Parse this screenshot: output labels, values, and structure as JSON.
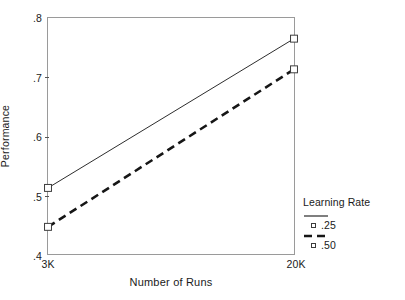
{
  "chart_data": {
    "type": "line",
    "title": "",
    "xlabel": "Number of Runs",
    "ylabel": "Performance",
    "categories": [
      "3K",
      "20K"
    ],
    "x_tick_labels": [
      "3K",
      "20K"
    ],
    "y_tick_labels": [
      ".8",
      ".7",
      ".6",
      ".5",
      ".4"
    ],
    "y_tick_values": [
      0.8,
      0.7,
      0.6,
      0.5,
      0.4
    ],
    "ylim": [
      0.4,
      0.8
    ],
    "xlim": [
      0,
      1
    ],
    "grid": false,
    "legend_position": "right",
    "legend_title": "Learning Rate",
    "marker": "open-square",
    "series": [
      {
        "name": ".25",
        "linestyle": "solid",
        "linewidth": 1,
        "color": "#2b2b2b",
        "values": [
          0.512,
          0.765
        ]
      },
      {
        "name": ".50",
        "linestyle": "dashed",
        "linewidth": 2.6,
        "color": "#161616",
        "values": [
          0.446,
          0.713
        ]
      }
    ]
  },
  "axes": {
    "y_title": "Performance",
    "x_title": "Number of Runs",
    "y_ticks": [
      {
        "label": ".8",
        "value": 0.8
      },
      {
        "label": ".7",
        "value": 0.7
      },
      {
        "label": ".6",
        "value": 0.6
      },
      {
        "label": ".5",
        "value": 0.5
      },
      {
        "label": ".4",
        "value": 0.4
      }
    ],
    "x_ticks": [
      {
        "label": "3K",
        "pos": 0
      },
      {
        "label": "20K",
        "pos": 1
      }
    ]
  },
  "legend": {
    "title": "Learning Rate",
    "entries": [
      {
        "label": ".25",
        "style": "solid"
      },
      {
        "label": ".50",
        "style": "dashed"
      }
    ]
  },
  "colors": {
    "background": "#ffffff",
    "frame": "#9a9a9a",
    "text": "#1a1a1a",
    "line_solid": "#2b2b2b",
    "line_dashed": "#161616",
    "marker_edge": "#3b3b3b",
    "marker_fill": "#ffffff"
  }
}
